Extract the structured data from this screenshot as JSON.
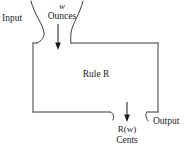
{
  "diagram": {
    "stroke_color": "#3a3a3a",
    "background_color": "#ffffff",
    "labels": {
      "input": "Input",
      "variable": "w",
      "input_unit": "Ounces",
      "rule_prefix": "Rule ",
      "rule_name": "R",
      "output_expression": "R(w)",
      "output_expression_fn": "R",
      "output_expression_open": "(",
      "output_expression_arg": "w",
      "output_expression_close": ")",
      "output_unit": "Cents",
      "output": "Output"
    },
    "shapes": {
      "box": {
        "x": 33,
        "y": 43,
        "width": 125,
        "height": 69
      },
      "input_arrow": {
        "x": 58,
        "y_start": 24,
        "y_end": 48
      },
      "output_arrow": {
        "x": 127,
        "y_start": 102,
        "y_end": 122
      },
      "hopper_left_top_x": 31,
      "hopper_right_top_x": 83,
      "chute_left_end_x": 112,
      "chute_right_start_x": 147
    }
  }
}
